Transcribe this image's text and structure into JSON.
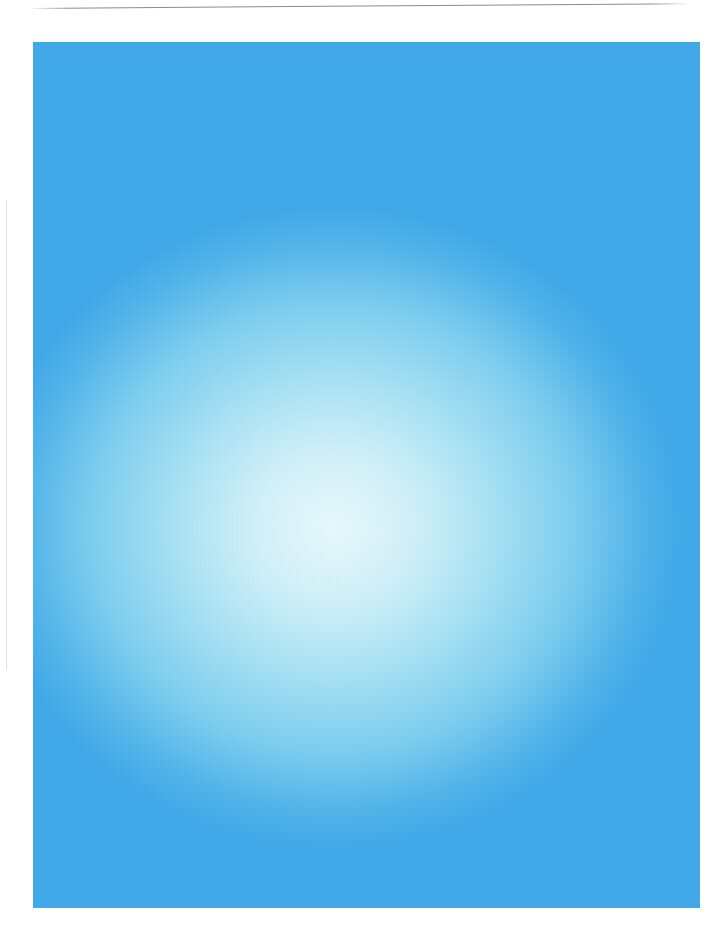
{
  "map": {
    "title": "St Kitts and Nevis",
    "colors": {
      "ocean_light": "#e2f7fb",
      "ocean_mid": "#76cbf0",
      "ocean_deep": "#3da9e8",
      "land_fill": "#fbf8e3",
      "land_outline": "#121a38",
      "town_dot": "#15805b",
      "road_badge": "#ec3b16",
      "label_text": "#14253f",
      "island_label_text": "#1d3a5c",
      "road_line": "#9aa8a0"
    },
    "islands": [
      {
        "id": "st-kitts",
        "label": "St Kitts",
        "x": 330,
        "y": 262
      },
      {
        "id": "nevis",
        "label": "Nevis",
        "x": 431,
        "y": 686
      }
    ],
    "capital": {
      "name": "Basseterre",
      "symbol": "capital-star-icon",
      "x": 343,
      "y": 393
    },
    "towns": [
      {
        "name": "Dieppe Bay Town",
        "dot_x": 164,
        "dot_y": 196,
        "label_x": 172,
        "label_y": 192,
        "island": "St Kitts"
      },
      {
        "name": "St Paul's",
        "dot_x": 97,
        "dot_y": 224,
        "label_x": 86,
        "label_y": 231,
        "island": "St Kitts"
      },
      {
        "name": "Sadlers",
        "dot_x": 212,
        "dot_y": 228,
        "label_x": 177,
        "label_y": 230,
        "island": "St Kitts"
      },
      {
        "name": "Newton Ground",
        "dot_x": 79,
        "dot_y": 263,
        "label_x": 80,
        "label_y": 272,
        "island": "St Kitts"
      },
      {
        "name": "Tabernacle",
        "dot_x": 261,
        "dot_y": 268,
        "label_x": 234,
        "label_y": 280,
        "island": "St Kitts"
      },
      {
        "name": "Sandy Point Town",
        "dot_x": 90,
        "dot_y": 301,
        "label_x": 99,
        "label_y": 300,
        "island": "St Kitts"
      },
      {
        "name": "Half Way Tree",
        "dot_x": 126,
        "dot_y": 345,
        "label_x": 135,
        "label_y": 343,
        "island": "St Kitts"
      },
      {
        "name": "Cayon",
        "dot_x": 321,
        "dot_y": 341,
        "label_x": 303,
        "label_y": 354,
        "island": "St Kitts"
      },
      {
        "name": "Old Road Town",
        "dot_x": 154,
        "dot_y": 368,
        "label_x": 165,
        "label_y": 366,
        "island": "St Kitts"
      },
      {
        "name": "Boyd's",
        "dot_x": 212,
        "dot_y": 412,
        "label_x": 220,
        "label_y": 404,
        "island": "St Kitts"
      },
      {
        "name": "Basseterre",
        "dot_x": 335,
        "dot_y": 418,
        "label_x": 312,
        "label_y": 406,
        "island": "St Kitts"
      },
      {
        "name": "Newcastle",
        "dot_x": 573,
        "dot_y": 592,
        "label_x": 552,
        "label_y": 601,
        "island": "Nevis"
      },
      {
        "name": "Whitehall",
        "dot_x": 630,
        "dot_y": 630,
        "label_x": 617,
        "label_y": 639,
        "island": "Nevis"
      },
      {
        "name": "Cotton Ground",
        "dot_x": 513,
        "dot_y": 641,
        "label_x": 501,
        "label_y": 650,
        "island": "Nevis"
      },
      {
        "name": "New River",
        "dot_x": 646,
        "dot_y": 705,
        "label_x": 596,
        "label_y": 696,
        "island": "Nevis"
      },
      {
        "name": "Charlestown",
        "dot_x": 496,
        "dot_y": 716,
        "label_x": 504,
        "label_y": 707,
        "island": "Nevis"
      },
      {
        "name": "Brown Hill",
        "dot_x": 550,
        "dot_y": 748,
        "label_x": 560,
        "label_y": 753,
        "island": "Nevis"
      }
    ],
    "road_badges": [
      {
        "number": "226",
        "x": 143,
        "y": 188,
        "island": "St Kitts"
      },
      {
        "number": "228",
        "x": 122,
        "y": 229,
        "island": "St Kitts"
      },
      {
        "number": "227",
        "x": 327,
        "y": 423,
        "island": "St Kitts"
      },
      {
        "number": "225",
        "x": 579,
        "y": 586,
        "island": "Nevis"
      },
      {
        "number": "223",
        "x": 601,
        "y": 711,
        "island": "Nevis"
      },
      {
        "number": "224",
        "x": 601,
        "y": 733,
        "island": "Nevis"
      }
    ]
  }
}
